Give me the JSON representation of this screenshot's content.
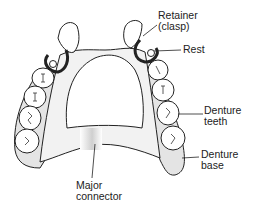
{
  "diagram": {
    "labels": {
      "retainer": [
        "Retainer",
        "(clasp)"
      ],
      "rest": "Rest",
      "denture_teeth": [
        "Denture",
        "teeth"
      ],
      "denture_base": [
        "Denture",
        "base"
      ],
      "major_connector": [
        "Major",
        "connector"
      ]
    },
    "colors": {
      "line": "#222222",
      "base_fill": "#e4e4e4",
      "tooth_fill": "#ffffff",
      "background": "#ffffff"
    }
  }
}
